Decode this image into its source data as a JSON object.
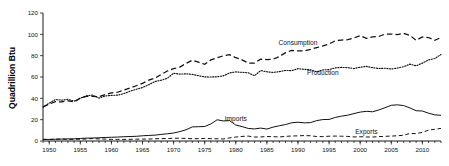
{
  "chart_data": {
    "type": "line",
    "title": "",
    "subtitle": "",
    "xlabel": "",
    "ylabel": "Quadrillion Btu",
    "xlim": [
      1949,
      2013
    ],
    "ylim": [
      0,
      120
    ],
    "grid": false,
    "legend_position": "inline-annotations",
    "y_ticks": [
      0,
      20,
      40,
      60,
      80,
      100,
      120
    ],
    "y_ticklabels": [
      "0",
      "20",
      "40",
      "60",
      "80",
      "100",
      "120"
    ],
    "x_ticks": [
      1950,
      1955,
      1960,
      1965,
      1970,
      1975,
      1980,
      1985,
      1990,
      1995,
      2000,
      2005,
      2010
    ],
    "x_ticklabels": [
      "1950",
      "1955",
      "1960",
      "1965",
      "1970",
      "1975",
      "1980",
      "1985",
      "1990",
      "1995",
      "2000",
      "2005",
      "2010"
    ],
    "x_minor_tick_interval": 1,
    "x": [
      1949,
      1950,
      1951,
      1952,
      1953,
      1954,
      1955,
      1956,
      1957,
      1958,
      1959,
      1960,
      1961,
      1962,
      1963,
      1964,
      1965,
      1966,
      1967,
      1968,
      1969,
      1970,
      1971,
      1972,
      1973,
      1974,
      1975,
      1976,
      1977,
      1978,
      1979,
      1980,
      1981,
      1982,
      1983,
      1984,
      1985,
      1986,
      1987,
      1988,
      1989,
      1990,
      1991,
      1992,
      1993,
      1994,
      1995,
      1996,
      1997,
      1998,
      1999,
      2000,
      2001,
      2002,
      2003,
      2004,
      2005,
      2006,
      2007,
      2008,
      2009,
      2010,
      2011,
      2012,
      2013
    ],
    "series": [
      {
        "name": "Consumption",
        "line_style": "dashed",
        "label_x": 1990,
        "label_y": 90,
        "values": [
          32.0,
          34.6,
          36.9,
          36.7,
          37.7,
          36.6,
          40.2,
          41.8,
          41.8,
          41.6,
          43.5,
          45.1,
          45.7,
          47.8,
          49.6,
          51.8,
          54.0,
          57.0,
          58.9,
          62.4,
          65.6,
          67.8,
          69.3,
          72.7,
          75.7,
          73.9,
          71.9,
          76.0,
          78.0,
          79.9,
          80.9,
          78.1,
          76.1,
          73.1,
          73.0,
          76.7,
          76.4,
          76.7,
          79.1,
          82.8,
          84.9,
          84.5,
          84.5,
          85.9,
          87.5,
          89.1,
          91.0,
          94.0,
          94.6,
          95.0,
          96.6,
          98.8,
          96.2,
          97.6,
          98.0,
          100.2,
          100.2,
          99.7,
          101.0,
          99.0,
          94.4,
          97.5,
          97.0,
          94.4,
          97.1
        ]
      },
      {
        "name": "Production",
        "line_style": "dotted",
        "label_x": 1994,
        "label_y": 62,
        "values": [
          31.7,
          35.5,
          38.8,
          38.3,
          39.0,
          37.4,
          40.1,
          42.4,
          43.0,
          40.2,
          42.2,
          42.8,
          43.0,
          44.4,
          46.7,
          48.5,
          50.1,
          52.8,
          55.8,
          56.9,
          58.9,
          63.5,
          62.7,
          63.0,
          62.4,
          61.2,
          60.1,
          60.0,
          60.2,
          61.1,
          63.8,
          64.8,
          64.4,
          63.9,
          61.2,
          66.0,
          64.9,
          64.3,
          65.0,
          66.1,
          66.0,
          67.8,
          67.2,
          66.8,
          64.9,
          66.6,
          67.0,
          68.6,
          69.0,
          68.8,
          67.9,
          69.2,
          69.9,
          68.7,
          68.0,
          68.2,
          67.5,
          68.4,
          69.7,
          72.0,
          70.5,
          73.0,
          76.1,
          77.3,
          81.1
        ]
      },
      {
        "name": "Imports",
        "line_style": "solid",
        "label_x": 1980,
        "label_y": 19,
        "values": [
          1.4,
          1.5,
          1.6,
          1.8,
          2.0,
          2.0,
          2.4,
          2.7,
          2.8,
          3.0,
          3.3,
          3.5,
          3.7,
          4.0,
          4.2,
          4.4,
          4.9,
          5.2,
          5.5,
          6.2,
          6.8,
          7.5,
          8.8,
          10.5,
          13.2,
          13.4,
          13.6,
          16.0,
          19.9,
          18.8,
          19.1,
          15.0,
          13.5,
          11.8,
          11.3,
          12.1,
          11.2,
          13.0,
          14.3,
          15.4,
          17.1,
          17.6,
          17.0,
          17.2,
          19.1,
          20.1,
          20.2,
          22.1,
          23.3,
          24.2,
          25.7,
          27.1,
          27.8,
          27.4,
          29.1,
          31.2,
          33.5,
          33.9,
          33.2,
          31.0,
          28.4,
          28.1,
          26.1,
          24.5,
          24.1
        ]
      },
      {
        "name": "Exports",
        "line_style": "dashed",
        "label_x": 2001,
        "label_y": 6.5,
        "values": [
          1.6,
          1.4,
          1.8,
          1.8,
          1.5,
          1.6,
          1.7,
          1.9,
          2.3,
          1.9,
          1.8,
          1.5,
          1.5,
          1.5,
          1.6,
          1.7,
          1.8,
          1.8,
          2.1,
          2.2,
          2.3,
          2.6,
          2.6,
          2.4,
          2.1,
          2.2,
          2.4,
          2.2,
          2.1,
          1.9,
          2.9,
          3.7,
          4.3,
          4.6,
          3.7,
          3.8,
          4.2,
          4.0,
          3.8,
          4.3,
          4.7,
          4.8,
          5.1,
          4.9,
          4.2,
          4.1,
          4.5,
          4.6,
          4.5,
          4.3,
          3.8,
          4.0,
          3.8,
          3.7,
          4.1,
          4.4,
          4.6,
          4.9,
          5.4,
          7.1,
          6.9,
          8.1,
          10.2,
          11.0,
          11.8
        ]
      }
    ]
  }
}
